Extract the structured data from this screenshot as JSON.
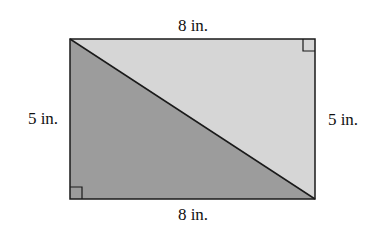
{
  "figure": {
    "shape": "rectangle divided by diagonal into two right triangles",
    "labels": {
      "top": "8 in.",
      "left": "5 in.",
      "right": "5 in.",
      "bottom": "8 in."
    },
    "colors": {
      "upper_triangle": "#d6d6d6",
      "lower_triangle": "#9c9c9c",
      "stroke": "#1a1a1a"
    },
    "right_angle_marks": [
      "top-right",
      "bottom-left"
    ]
  }
}
